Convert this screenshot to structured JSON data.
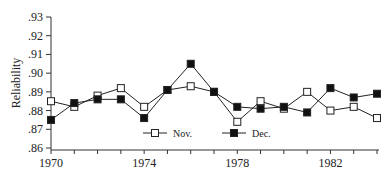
{
  "chart_data": {
    "type": "line",
    "title": "",
    "xlabel": "",
    "ylabel": "Reliability",
    "x": [
      1970,
      1971,
      1972,
      1973,
      1974,
      1975,
      1976,
      1977,
      1978,
      1979,
      1980,
      1981,
      1982,
      1983,
      1984
    ],
    "series": [
      {
        "name": "Nov.",
        "marker": "open-square",
        "values": [
          0.885,
          0.882,
          0.888,
          0.892,
          0.882,
          0.891,
          0.893,
          0.89,
          0.874,
          0.885,
          0.881,
          0.89,
          0.88,
          0.882,
          0.876
        ]
      },
      {
        "name": "Dec.",
        "marker": "filled-square",
        "values": [
          0.875,
          0.884,
          0.886,
          0.886,
          0.876,
          0.891,
          0.905,
          0.89,
          0.882,
          0.881,
          0.882,
          0.879,
          0.892,
          0.887,
          0.889
        ]
      }
    ],
    "xticks": [
      1970,
      1971,
      1972,
      1973,
      1974,
      1975,
      1976,
      1977,
      1978,
      1979,
      1980,
      1981,
      1982,
      1983,
      1984
    ],
    "xtick_labels": [
      "1970",
      "1974",
      "1978",
      "1982"
    ],
    "yticks": [
      0.86,
      0.87,
      0.88,
      0.89,
      0.9,
      0.91,
      0.92,
      0.93
    ],
    "ytick_labels": [
      ".86",
      ".87",
      ".88",
      ".89",
      ".90",
      ".91",
      ".92",
      ".93"
    ],
    "xlim": [
      1970,
      1984
    ],
    "ylim": [
      0.86,
      0.93
    ],
    "grid": false,
    "legend_position": "inside-bottom-center"
  },
  "colors": {
    "line": "#222222",
    "axis": "#333333",
    "marker_fill_open": "#ffffff",
    "marker_fill_filled": "#111111"
  }
}
